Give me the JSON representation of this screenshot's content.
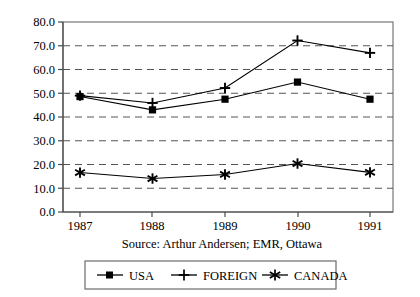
{
  "chart_data": {
    "type": "line",
    "title": "",
    "subtitle": "",
    "xlabel": "",
    "ylabel": "",
    "categories": [
      "1987",
      "1988",
      "1989",
      "1990",
      "1991"
    ],
    "x_tick_labels": [
      "1987",
      "1988",
      "1989",
      "1990",
      "1991"
    ],
    "y_tick_labels": [
      "0.0",
      "10.0",
      "20.0",
      "30.0",
      "40.0",
      "50.0",
      "60.0",
      "70.0",
      "80.0"
    ],
    "y_tick_values": [
      0,
      10,
      20,
      30,
      40,
      50,
      60,
      70,
      80
    ],
    "ylim": [
      0,
      80
    ],
    "grid": "horizontal-dashed",
    "legend_position": "below-outside",
    "series": [
      {
        "name": "USA",
        "marker": "square",
        "color": "#000000",
        "values": [
          48.6,
          43.0,
          47.5,
          54.7,
          47.5
        ]
      },
      {
        "name": "FOREIGN",
        "marker": "plus",
        "color": "#000000",
        "values": [
          49.0,
          45.9,
          52.2,
          72.2,
          67.0
        ]
      },
      {
        "name": "CANADA",
        "marker": "asterisk",
        "color": "#000000",
        "values": [
          16.6,
          14.1,
          15.8,
          20.4,
          16.7
        ]
      }
    ],
    "annotations": {
      "source": "Source: Arthur Andersen; EMR, Ottawa"
    }
  },
  "legend": {
    "items": [
      {
        "label": "USA",
        "marker": "square"
      },
      {
        "label": "FOREIGN",
        "marker": "plus"
      },
      {
        "label": "CANADA",
        "marker": "asterisk"
      }
    ]
  },
  "colors": {
    "background": "#ffffff",
    "ink": "#000000",
    "axis": "#4a4a4a",
    "grid": "#555555",
    "frame": "#6b6b6b"
  }
}
